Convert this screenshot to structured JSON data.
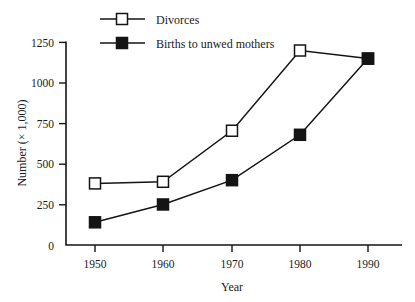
{
  "chart_data": {
    "type": "line",
    "title": "",
    "xlabel": "Year",
    "ylabel": "Number (× 1,000)",
    "x": [
      1950,
      1960,
      1970,
      1980,
      1990
    ],
    "categories": [
      "1950",
      "1960",
      "1970",
      "1980",
      "1990"
    ],
    "xtick_labels": [
      "1950",
      "1960",
      "1970",
      "1980",
      "1990"
    ],
    "ytick_labels": [
      "0",
      "250",
      "500",
      "750",
      "1000",
      "1250"
    ],
    "ytick_values": [
      0,
      250,
      500,
      750,
      1000,
      1250
    ],
    "xlim": [
      1945,
      1995
    ],
    "ylim": [
      0,
      1250
    ],
    "grid": false,
    "legend_position": "top-left",
    "series": [
      {
        "name": "Divorces",
        "marker": "open-square",
        "values": [
          380,
          390,
          705,
          1200,
          1150
        ]
      },
      {
        "name": "Births to unwed mothers",
        "marker": "filled-square",
        "values": [
          140,
          250,
          400,
          680,
          1150
        ]
      }
    ]
  },
  "legend": {
    "items": [
      {
        "label": "Divorces",
        "marker": "open-square"
      },
      {
        "label": "Births to unwed mothers",
        "marker": "filled-square"
      }
    ]
  },
  "colors": {
    "ink": "#141414",
    "background": "#ffffff",
    "marker_fill_open": "#ffffff",
    "marker_fill_closed": "#141414"
  }
}
